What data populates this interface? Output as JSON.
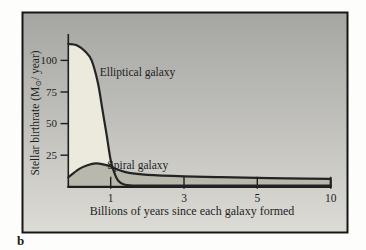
{
  "figure": {
    "panel_label": "b",
    "colors": {
      "frame": "#161616",
      "bg_top": "#a5a5a2",
      "bg_bottom": "#dcdbd5",
      "fill_elliptical": "#eceadc",
      "fill_spiral": "#b9b8ac",
      "curve": "#242424",
      "axis": "#1e1e1e",
      "text": "#1e1e1e"
    }
  },
  "chart_data": {
    "type": "line",
    "title": "",
    "xlabel": "Billions of years since each galaxy formed",
    "ylabel": "Stellar birthrate (M⊙/ year)",
    "x_ticks": [
      1,
      3,
      5,
      10
    ],
    "x_axis_note": "nonlinear scale: ticks 1, 3, 5, 10 are equally spaced",
    "y_ticks": [
      25,
      50,
      75,
      100
    ],
    "xlim": [
      0,
      10
    ],
    "ylim": [
      0,
      115
    ],
    "grid": false,
    "legend": "inline labels beside curves",
    "series": [
      {
        "name": "Elliptical galaxy",
        "x": [
          0,
          0.2,
          0.4,
          0.55,
          0.7,
          0.8,
          0.9,
          1.0,
          1.1,
          1.2,
          1.35,
          1.6,
          2,
          3,
          5,
          10
        ],
        "y": [
          113,
          112,
          107,
          100,
          82,
          62,
          42,
          21,
          11,
          5,
          2,
          1,
          1,
          1,
          1,
          1
        ]
      },
      {
        "name": "Spiral galaxy",
        "x": [
          0,
          0.25,
          0.45,
          0.65,
          0.85,
          1.0,
          1.2,
          1.5,
          2,
          3,
          4,
          5,
          7,
          10
        ],
        "y": [
          7.5,
          14,
          17,
          18.5,
          17.5,
          16,
          13.5,
          11,
          9.5,
          8.3,
          7.6,
          7.1,
          6.7,
          6.3
        ]
      }
    ],
    "annotations": [
      {
        "text": "Elliptical galaxy",
        "x": 0.74,
        "y": 88
      },
      {
        "text": "Spiral galaxy",
        "x": 0.92,
        "y": 14
      }
    ]
  }
}
